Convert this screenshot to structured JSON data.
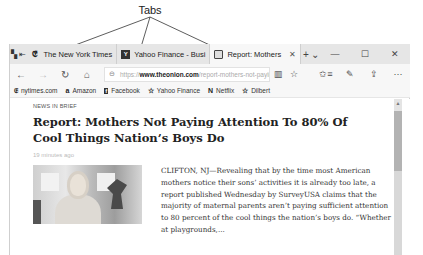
{
  "callout": {
    "label": "Tabs"
  },
  "tabbar": {
    "left_icons": [
      {
        "name": "tab-preview-icon",
        "glyph": "▚"
      },
      {
        "name": "set-aside-tabs-icon",
        "glyph": "⇤"
      }
    ],
    "tabs": [
      {
        "title": "The New York Times",
        "favicon": "𝔈",
        "active": false
      },
      {
        "title": "Yahoo Finance - Busi",
        "favicon": "Y",
        "active": false
      },
      {
        "title": "Report: Mothers",
        "favicon": "▤",
        "active": true,
        "close": "✕"
      }
    ],
    "new_tab": "+",
    "tab_list": "⌄",
    "window_controls": {
      "minimize": "—",
      "maximize": "☐",
      "close": "✕"
    }
  },
  "navbar": {
    "back": "←",
    "forward": "→",
    "refresh": "↻",
    "home": "⌂",
    "address": {
      "lock": "🔒",
      "protocol": "https://",
      "host": "www.theonion.com",
      "path": "/report-mothers-not-payin"
    },
    "reading_view": "📖",
    "favorite": "☆",
    "favorites_hub": "✩≡",
    "notes": "✎",
    "share": "⇪",
    "more": "···"
  },
  "favorites_bar": {
    "items": [
      {
        "label": "nytimes.com",
        "icon": "𝔈"
      },
      {
        "label": "Amazon",
        "icon": "a"
      },
      {
        "label": "Facebook",
        "icon": "f"
      },
      {
        "label": "Yahoo Finance",
        "icon": "☆"
      },
      {
        "label": "Netflix",
        "icon": "N"
      },
      {
        "label": "Dilbert",
        "icon": "☆"
      }
    ]
  },
  "article": {
    "kicker": "NEWS IN BRIEF",
    "headline": "Report: Mothers Not Paying Attention To 80% Of Cool Things Nation’s Boys Do",
    "timestamp": "19 minutes ago",
    "body": "CLIFTON, NJ—Revealing that by the time most American mothers notice their sons’ activities it is already too late, a report published Wednesday by SurveyUSA claims that the majority of maternal parents aren’t paying sufficient attention to 80 percent of the cool things the nation’s boys do. “Whether at playgrounds,..."
  },
  "scrollbar": {
    "up_arrow": "▲"
  }
}
